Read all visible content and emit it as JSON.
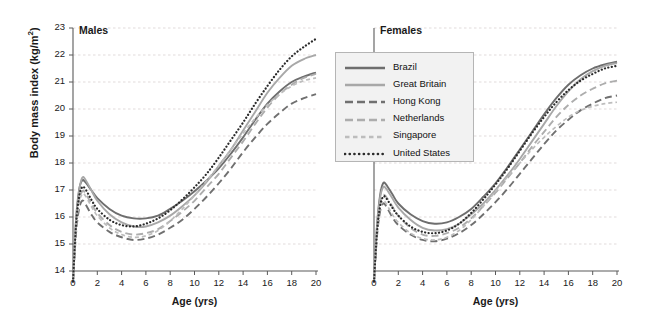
{
  "figure": {
    "ylabel": "Body mass index (kg/m",
    "ylabel_sup": "2",
    "ylabel_close": ")",
    "panels": [
      {
        "title": "Males",
        "xlabel": "Age (yrs)"
      },
      {
        "title": "Females",
        "xlabel": "Age (yrs)"
      }
    ]
  },
  "legend": {
    "position": "top-center",
    "items": [
      {
        "label": "Brazil",
        "style": "solid",
        "color": "#6e6e6e",
        "width": 1.9
      },
      {
        "label": "Great Britain",
        "style": "solid",
        "color": "#a8a8a8",
        "width": 1.9
      },
      {
        "label": "Hong Kong",
        "style": "dashed-long",
        "color": "#707070",
        "width": 1.9
      },
      {
        "label": "Netherlands",
        "style": "dashed-long",
        "color": "#adadad",
        "width": 1.9
      },
      {
        "label": "Singapore",
        "style": "dashed-short",
        "color": "#bdbdbd",
        "width": 1.7
      },
      {
        "label": "United States",
        "style": "dotted",
        "color": "#2b2b2b",
        "width": 2.2
      }
    ]
  },
  "chart_data": {
    "type": "line",
    "title": "",
    "xlabel": "Age (yrs)",
    "ylabel": "Body mass index (kg/m2)",
    "xlim": [
      0,
      20
    ],
    "ylim": [
      14,
      23
    ],
    "xticks": [
      0,
      2,
      4,
      6,
      8,
      10,
      12,
      14,
      16,
      18,
      20
    ],
    "yticks": [
      14,
      15,
      16,
      17,
      18,
      19,
      20,
      21,
      22,
      23
    ],
    "grid": "horizontal-dashed",
    "legend_position": "top-center",
    "panels": [
      {
        "name": "Males",
        "x": [
          0,
          0.25,
          0.5,
          0.75,
          1,
          1.5,
          2,
          3,
          4,
          5,
          6,
          7,
          8,
          9,
          10,
          11,
          12,
          13,
          14,
          15,
          16,
          17,
          18,
          19,
          20
        ],
        "series": [
          {
            "name": "Brazil",
            "values": [
              13.6,
              15.9,
              17.0,
              17.35,
              17.3,
              17.0,
              16.7,
              16.3,
              16.05,
              15.95,
              15.95,
              16.05,
              16.3,
              16.6,
              16.95,
              17.35,
              17.8,
              18.35,
              18.95,
              19.6,
              20.2,
              20.65,
              21.0,
              21.2,
              21.35
            ]
          },
          {
            "name": "Great Britain",
            "values": [
              13.6,
              15.85,
              16.95,
              17.45,
              17.4,
              17.0,
              16.6,
              16.1,
              15.8,
              15.65,
              15.65,
              15.8,
              16.05,
              16.4,
              16.8,
              17.3,
              17.9,
              18.5,
              19.2,
              19.9,
              20.6,
              21.15,
              21.6,
              21.85,
              22.0
            ]
          },
          {
            "name": "Hong Kong",
            "values": [
              13.6,
              15.4,
              16.3,
              16.6,
              16.5,
              16.1,
              15.8,
              15.45,
              15.25,
              15.15,
              15.2,
              15.35,
              15.6,
              15.9,
              16.3,
              16.75,
              17.25,
              17.8,
              18.4,
              18.95,
              19.45,
              19.85,
              20.2,
              20.4,
              20.55
            ]
          },
          {
            "name": "Netherlands",
            "values": [
              13.6,
              15.6,
              16.6,
              16.95,
              16.9,
              16.5,
              16.15,
              15.7,
              15.45,
              15.35,
              15.4,
              15.55,
              15.85,
              16.2,
              16.6,
              17.1,
              17.6,
              18.2,
              18.8,
              19.45,
              20.05,
              20.55,
              20.9,
              21.15,
              21.3
            ]
          },
          {
            "name": "Singapore",
            "values": [
              13.6,
              15.5,
              16.5,
              16.85,
              16.8,
              16.4,
              16.05,
              15.6,
              15.35,
              15.25,
              15.3,
              15.5,
              15.85,
              16.3,
              16.8,
              17.35,
              17.9,
              18.5,
              19.1,
              19.65,
              20.15,
              20.55,
              20.85,
              21.05,
              21.15
            ]
          },
          {
            "name": "United States",
            "values": [
              13.6,
              15.7,
              16.75,
              17.1,
              17.05,
              16.65,
              16.3,
              15.9,
              15.7,
              15.65,
              15.75,
              15.95,
              16.25,
              16.65,
              17.1,
              17.6,
              18.2,
              18.85,
              19.5,
              20.2,
              20.85,
              21.45,
              21.95,
              22.3,
              22.6
            ]
          }
        ]
      },
      {
        "name": "Females",
        "x": [
          0,
          0.25,
          0.5,
          0.75,
          1,
          1.5,
          2,
          3,
          4,
          5,
          6,
          7,
          8,
          9,
          10,
          11,
          12,
          13,
          14,
          15,
          16,
          17,
          18,
          19,
          20
        ],
        "series": [
          {
            "name": "Brazil",
            "values": [
              13.6,
              15.7,
              16.8,
              17.25,
              17.2,
              16.85,
              16.5,
              16.1,
              15.85,
              15.75,
              15.8,
              16.0,
              16.3,
              16.75,
              17.25,
              17.85,
              18.5,
              19.15,
              19.8,
              20.4,
              20.9,
              21.25,
              21.5,
              21.65,
              21.75
            ]
          },
          {
            "name": "Great Britain",
            "values": [
              13.6,
              15.65,
              16.7,
              17.1,
              17.05,
              16.7,
              16.35,
              15.9,
              15.6,
              15.5,
              15.55,
              15.75,
              16.1,
              16.5,
              17.0,
              17.55,
              18.15,
              18.8,
              19.45,
              20.1,
              20.65,
              21.1,
              21.4,
              21.6,
              21.7
            ]
          },
          {
            "name": "Hong Kong",
            "values": [
              13.6,
              15.3,
              16.2,
              16.5,
              16.4,
              16.0,
              15.7,
              15.35,
              15.15,
              15.1,
              15.2,
              15.4,
              15.7,
              16.1,
              16.55,
              17.05,
              17.6,
              18.15,
              18.7,
              19.2,
              19.6,
              19.95,
              20.2,
              20.4,
              20.5
            ]
          },
          {
            "name": "Netherlands",
            "values": [
              13.6,
              15.5,
              16.45,
              16.8,
              16.75,
              16.4,
              16.05,
              15.6,
              15.35,
              15.3,
              15.4,
              15.6,
              15.95,
              16.4,
              16.9,
              17.45,
              18.0,
              18.6,
              19.15,
              19.7,
              20.15,
              20.5,
              20.75,
              20.95,
              21.05
            ]
          },
          {
            "name": "Singapore",
            "values": [
              13.6,
              15.35,
              16.3,
              16.6,
              16.5,
              16.1,
              15.8,
              15.4,
              15.2,
              15.15,
              15.25,
              15.5,
              15.9,
              16.4,
              16.95,
              17.5,
              18.0,
              18.5,
              18.95,
              19.35,
              19.7,
              19.95,
              20.1,
              20.2,
              20.25
            ]
          },
          {
            "name": "United States",
            "values": [
              13.6,
              15.45,
              16.4,
              16.75,
              16.7,
              16.35,
              16.05,
              15.65,
              15.45,
              15.4,
              15.5,
              15.75,
              16.15,
              16.65,
              17.2,
              17.8,
              18.45,
              19.1,
              19.7,
              20.25,
              20.7,
              21.05,
              21.3,
              21.5,
              21.6
            ]
          }
        ]
      }
    ]
  }
}
